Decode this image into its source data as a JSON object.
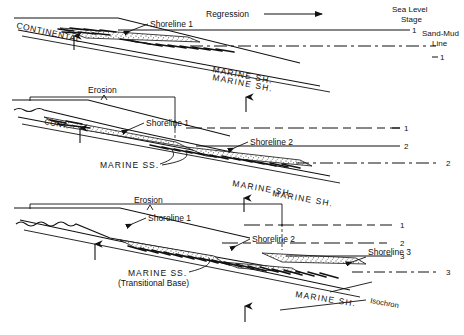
{
  "figure": {
    "type": "geological-cross-section",
    "panels": 3
  },
  "global": {
    "regression_label": "Regression",
    "sea_level_stage_label_line1": "Sea Level",
    "sea_level_stage_label_line2": "Stage",
    "sand_mud_label_line1": "Sand-Mud",
    "sand_mud_label_line2": "Line",
    "isochron_label": "Isochron"
  },
  "panel1": {
    "continental_label": "CONTINENTAL",
    "shoreline1_label": "Shoreline 1",
    "marine_sh_label": "MARINE SH.",
    "stage_number": "1",
    "sandmud_number": "1"
  },
  "panel2": {
    "erosion_label": "Erosion",
    "cont_label": "CONT.",
    "shoreline1_label": "Shoreline 1",
    "shoreline2_label": "Shoreline 2",
    "marine_ss_label": "MARINE SS.",
    "marine_sh_label_upper": "MARINE SH.",
    "marine_sh_label_lower": "MARINE SH.",
    "stage_number_1": "1",
    "stage_number_2": "2",
    "sandmud_number_2": "2"
  },
  "panel3": {
    "erosion_label": "Erosion",
    "shoreline1_label": "Shoreline 1",
    "shoreline2_label": "Shoreline 2",
    "shoreline3_label": "Shoreline 3",
    "marine_ss_label_line1": "MARINE SS.",
    "marine_ss_label_line2": "(Transitional Base)",
    "marine_sh_label_upper": "MARINE SH.",
    "marine_sh_label_lower": "MARINE SH.",
    "stage_number_1": "1",
    "stage_number_2": "2",
    "stage_number_3": "3",
    "sandmud_number_3": "3",
    "isochron_label": "Isochron"
  },
  "colors": {
    "ink": "#111111",
    "background": "#ffffff"
  }
}
